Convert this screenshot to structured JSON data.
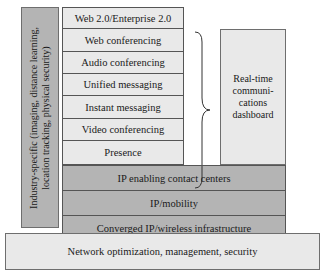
{
  "diagram": {
    "left_column": {
      "label": "Industry-specific (imaging, distance learning, location tracking, physical security)"
    },
    "application_stack": [
      {
        "label": "Web 2.0/Enterprise 2.0"
      },
      {
        "label": "Web conferencing"
      },
      {
        "label": "Audio conferencing"
      },
      {
        "label": "Unified messaging"
      },
      {
        "label": "Instant messaging"
      },
      {
        "label": "Video conferencing"
      },
      {
        "label": "Presence"
      }
    ],
    "dashboard": {
      "label": "Real-time communi- cations dashboard"
    },
    "infrastructure_layers": [
      {
        "label": "IP enabling contact centers"
      },
      {
        "label": "IP/mobility"
      },
      {
        "label": "Converged IP/wireless infrastructure"
      }
    ],
    "base": {
      "label": "Network optimization, management, security"
    },
    "colors": {
      "light_fill": "#e9e9e9",
      "dark_fill": "#b4b4b4",
      "border": "#6e6e6e"
    }
  }
}
